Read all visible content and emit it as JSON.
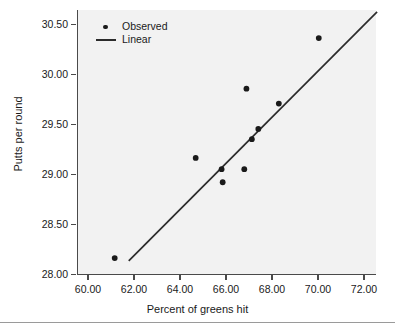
{
  "chart_data": {
    "type": "scatter",
    "title": "",
    "xlabel": "Percent of greens hit",
    "ylabel": "Putts per round",
    "xlim": [
      59.0,
      72.8
    ],
    "ylim": [
      27.88,
      30.7
    ],
    "xticks": [
      60.0,
      62.0,
      64.0,
      66.0,
      68.0,
      70.0,
      72.0
    ],
    "xtick_labels": [
      "60.00",
      "62.00",
      "64.00",
      "66.00",
      "68.00",
      "70.00",
      "72.00"
    ],
    "yticks": [
      28.0,
      28.5,
      29.0,
      29.5,
      30.0,
      30.5
    ],
    "ytick_labels": [
      "28.00",
      "28.50",
      "29.00",
      "29.50",
      "30.00",
      "30.50"
    ],
    "grid": false,
    "legend_position": "top-left",
    "series": [
      {
        "name": "Observed",
        "marker": "circle",
        "color": "#1a1a1a",
        "points": [
          {
            "x": 60.7,
            "y": 28.05
          },
          {
            "x": 64.45,
            "y": 29.12
          },
          {
            "x": 65.65,
            "y": 29.0
          },
          {
            "x": 65.7,
            "y": 28.86
          },
          {
            "x": 66.7,
            "y": 29.0
          },
          {
            "x": 66.8,
            "y": 29.86
          },
          {
            "x": 67.05,
            "y": 29.32
          },
          {
            "x": 67.35,
            "y": 29.43
          },
          {
            "x": 68.3,
            "y": 29.7
          },
          {
            "x": 70.15,
            "y": 30.4
          }
        ]
      },
      {
        "name": "Linear",
        "type": "line",
        "color": "#2b2b2b",
        "endpoints": [
          {
            "x": 61.35,
            "y": 28.02
          },
          {
            "x": 72.85,
            "y": 30.68
          }
        ]
      }
    ],
    "legend": [
      {
        "label": "Observed",
        "key": "dot"
      },
      {
        "label": "Linear",
        "key": "line"
      }
    ]
  }
}
